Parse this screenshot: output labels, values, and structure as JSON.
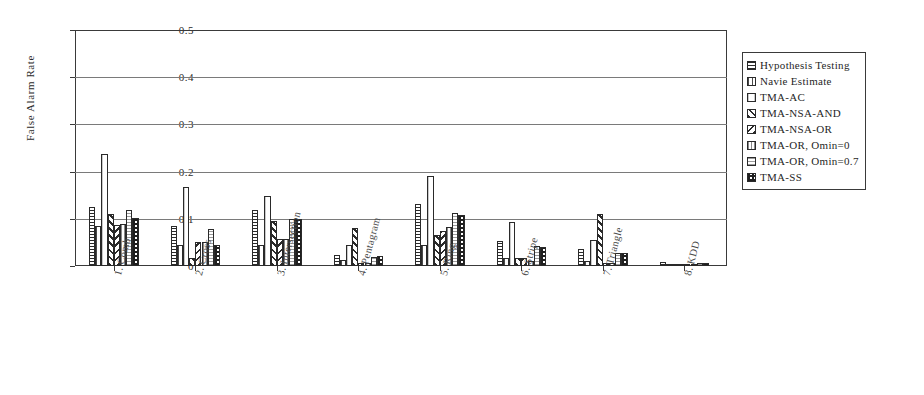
{
  "chart_data": {
    "type": "bar",
    "title": "",
    "subtitle": "",
    "xlabel": "",
    "ylabel": "False Alarm Rate",
    "ylim": [
      0,
      0.5
    ],
    "ytick_labels": [
      "0",
      "0.1",
      "0.2",
      "0.3",
      "0.4",
      "0.5"
    ],
    "ytick_values": [
      0,
      0.1,
      0.2,
      0.3,
      0.4,
      0.5
    ],
    "grid": true,
    "grid_axis": "y",
    "legend_position": "right",
    "orientation": "vertical",
    "grouping": "clustered",
    "categories": [
      "1. Comb",
      "2. Cross",
      "3. Intersection",
      "4. Pentagram",
      "5. Ring",
      "6. Stripe",
      "7. Triangle",
      "8. KDD"
    ],
    "series": [
      {
        "name": "Hypothesis Testing",
        "pattern": "horizontal-lines",
        "values": [
          0.124,
          0.085,
          0.118,
          0.023,
          0.132,
          0.052,
          0.035,
          0.008
        ]
      },
      {
        "name": "Navie Estimate",
        "pattern": "vertical-lines",
        "values": [
          0.085,
          0.045,
          0.045,
          0.013,
          0.045,
          0.017,
          0.01,
          0.004
        ]
      },
      {
        "name": "TMA-AC",
        "pattern": "light-dotted",
        "values": [
          0.237,
          0.167,
          0.148,
          0.045,
          0.191,
          0.093,
          0.055,
          0.003
        ]
      },
      {
        "name": "TMA-NSA-AND",
        "pattern": "back-diagonal",
        "values": [
          0.11,
          0.017,
          0.095,
          0.08,
          0.065,
          0.018,
          0.11,
          0.002
        ]
      },
      {
        "name": "TMA-NSA-OR",
        "pattern": "forward-diagonal",
        "values": [
          0.087,
          0.05,
          0.058,
          0.007,
          0.075,
          0.018,
          0.007,
          0.001
        ]
      },
      {
        "name": "TMA-OR, Omin=0",
        "pattern": "light-vertical-dash",
        "values": [
          0.089,
          0.05,
          0.058,
          0.007,
          0.082,
          0.01,
          0.007,
          0.001
        ]
      },
      {
        "name": "TMA-OR, Omin=0.7",
        "pattern": "fine-dot-grid",
        "values": [
          0.118,
          0.079,
          0.1,
          0.02,
          0.113,
          0.042,
          0.027,
          0.007
        ]
      },
      {
        "name": "TMA-SS",
        "pattern": "checkerboard",
        "values": [
          0.102,
          0.045,
          0.1,
          0.022,
          0.108,
          0.04,
          0.027,
          0.007
        ]
      }
    ]
  },
  "axes": {
    "y_title": "False Alarm Rate"
  },
  "legend": {
    "items": [
      {
        "label": "Hypothesis Testing"
      },
      {
        "label": "Navie Estimate"
      },
      {
        "label": "TMA-AC"
      },
      {
        "label": "TMA-NSA-AND"
      },
      {
        "label": "TMA-NSA-OR"
      },
      {
        "label": "TMA-OR, Omin=0"
      },
      {
        "label": "TMA-OR, Omin=0.7"
      },
      {
        "label": "TMA-SS"
      }
    ]
  },
  "colors": {
    "axis": "#3a3a3a",
    "grid": "#7a7a7a",
    "ink": "#1f1f1f",
    "background": "#ffffff"
  }
}
